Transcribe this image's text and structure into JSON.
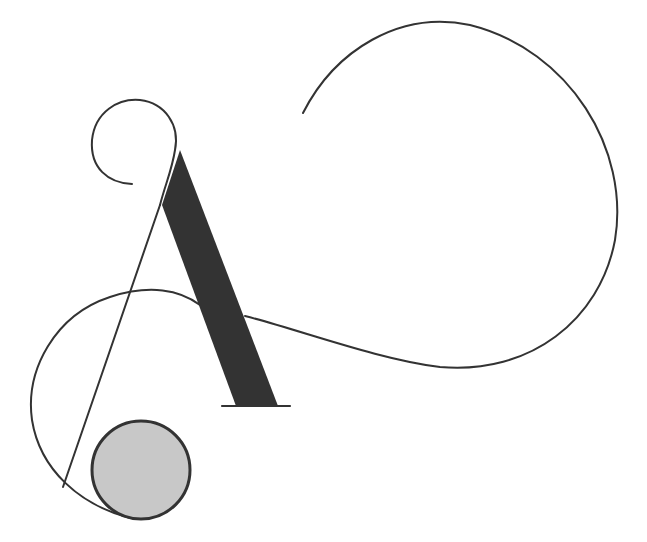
{
  "artwork": {
    "subject": "Ornamental letter A",
    "colors": {
      "background": "#ffffff",
      "stroke": "#333333",
      "thick_stroke": "#333333",
      "circle_fill": "#c8c8c8"
    }
  }
}
